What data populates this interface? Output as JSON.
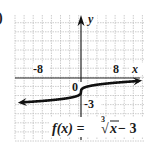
{
  "chart_data": {
    "type": "line",
    "title": "",
    "function_label": "f(x) = ∛x − 3",
    "function_parts": {
      "lhs": "f(x) = ",
      "index": "3",
      "radical": "√",
      "radicand": "x",
      "rhs": " − 3"
    },
    "xlabel": "x",
    "ylabel": "y",
    "xlim": [
      -14,
      14
    ],
    "ylim": [
      -13,
      14
    ],
    "grid": true,
    "grid_step": 2,
    "tick_labels": {
      "x": [
        "-8",
        "8"
      ],
      "y": [
        "-3"
      ],
      "origin": "0"
    },
    "x": [
      -14,
      -12,
      -10,
      -8,
      -6,
      -4,
      -2,
      -1,
      -0.5,
      -0.1,
      0,
      0.1,
      0.5,
      1,
      2,
      4,
      6,
      8,
      10,
      12,
      14
    ],
    "y": [
      -5.41,
      -5.29,
      -5.15,
      -5.0,
      -4.82,
      -4.59,
      -4.26,
      -4.0,
      -3.79,
      -3.46,
      -3.0,
      -2.54,
      -2.21,
      -2.0,
      -1.74,
      -1.41,
      -1.18,
      -1.0,
      -0.85,
      -0.71,
      -0.59
    ],
    "arrows": "both ends",
    "panel_marker": ")"
  },
  "colors": {
    "curve": "#111111",
    "grid": "#b8b8b8",
    "axis": "#222222",
    "text": "#1a1a1a"
  }
}
